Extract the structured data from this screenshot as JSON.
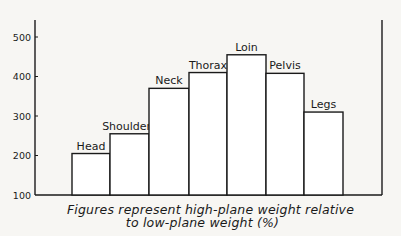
{
  "chart_data": {
    "type": "bar",
    "title": "",
    "xlabel": "",
    "ylabel": "",
    "categories": [
      "Head",
      "Shoulders",
      "Neck",
      "Thorax",
      "Loin",
      "Pelvis",
      "Legs"
    ],
    "values": [
      205,
      255,
      370,
      410,
      455,
      408,
      310
    ],
    "ylim": [
      100,
      560
    ],
    "yticks": [
      100,
      200,
      300,
      400,
      500
    ],
    "grid": false,
    "legend": null,
    "bar_labels_above": true,
    "caption": [
      "Figures represent high-plane weight relative",
      "to low-plane weight (%)"
    ]
  },
  "layout": {
    "axis_x": 35,
    "right_frame_x": 382,
    "top_y": 20,
    "baseline_y": 195,
    "y_at_500": 37,
    "bars_x": [
      [
        72,
        110
      ],
      [
        110,
        149
      ],
      [
        149,
        189
      ],
      [
        189,
        227
      ],
      [
        227,
        266
      ],
      [
        266,
        304
      ],
      [
        304,
        343
      ]
    ]
  },
  "colors": {
    "ink": "#1a1a1a",
    "paper": "#f7f6f3",
    "bar_fill": "#ffffff"
  }
}
